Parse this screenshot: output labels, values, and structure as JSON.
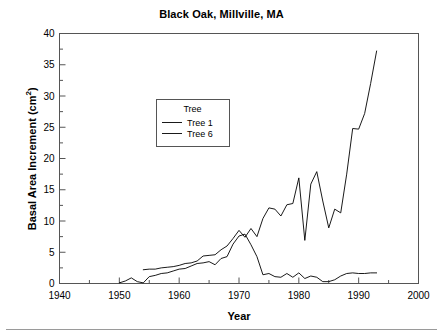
{
  "chart_data": {
    "type": "line",
    "title": "Black Oak, Millville, MA",
    "xlabel": "Year",
    "ylabel": "Basal Area Increment (cm²)",
    "xlim": [
      1940,
      2000
    ],
    "ylim": [
      0,
      40
    ],
    "xticks": [
      1940,
      1950,
      1960,
      1970,
      1980,
      1990,
      2000
    ],
    "xtick_labels": [
      "1940",
      "1950",
      "1960",
      "1970",
      "1980",
      "1990",
      "2000"
    ],
    "xminor_ticks": [
      1945,
      1955,
      1965,
      1975,
      1985,
      1995
    ],
    "yticks": [
      0,
      5,
      10,
      15,
      20,
      25,
      30,
      35,
      40
    ],
    "ytick_labels": [
      "0",
      "5",
      "10",
      "15",
      "20",
      "25",
      "30",
      "35",
      "40"
    ],
    "yminor_ticks": [
      2.5,
      7.5,
      12.5,
      17.5,
      22.5,
      27.5,
      32.5,
      37.5
    ],
    "grid": false,
    "legend_title": "Tree",
    "legend_position": "upper-left-inside",
    "line_color": "#000000",
    "series": [
      {
        "name": "Tree 1",
        "x": [
          1954,
          1955,
          1956,
          1957,
          1958,
          1959,
          1960,
          1961,
          1962,
          1963,
          1964,
          1965,
          1966,
          1967,
          1968,
          1969,
          1970,
          1971,
          1972,
          1973,
          1974,
          1975,
          1976,
          1977,
          1978,
          1979,
          1980,
          1981,
          1982,
          1983,
          1984,
          1985,
          1986,
          1987,
          1988,
          1989,
          1990,
          1991,
          1992,
          1993
        ],
        "values": [
          2.2,
          2.3,
          2.3,
          2.5,
          2.6,
          2.7,
          2.9,
          3.2,
          3.3,
          3.6,
          4.4,
          4.5,
          4.6,
          5.4,
          6.0,
          7.2,
          8.5,
          7.4,
          8.8,
          7.5,
          10.4,
          12.1,
          11.9,
          10.8,
          12.6,
          12.8,
          16.9,
          6.9,
          15.9,
          17.9,
          13.2,
          8.9,
          11.9,
          11.3,
          17.5,
          24.8,
          24.7,
          27.2,
          32.0,
          37.2
        ]
      },
      {
        "name": "Tree 6",
        "x": [
          1950,
          1951,
          1952,
          1953,
          1954,
          1955,
          1956,
          1957,
          1958,
          1959,
          1960,
          1961,
          1962,
          1963,
          1964,
          1965,
          1966,
          1967,
          1968,
          1969,
          1970,
          1971,
          1972,
          1973,
          1974,
          1975,
          1976,
          1977,
          1978,
          1979,
          1980,
          1981,
          1982,
          1983,
          1984,
          1985,
          1986,
          1987,
          1988,
          1989,
          1990,
          1991,
          1992,
          1993
        ],
        "values": [
          0.1,
          0.4,
          0.9,
          0.3,
          0.1,
          1.1,
          1.3,
          1.6,
          1.7,
          2.0,
          2.3,
          2.4,
          2.8,
          3.2,
          3.3,
          3.5,
          3.0,
          4.0,
          4.3,
          6.3,
          7.6,
          7.9,
          6.2,
          4.3,
          1.4,
          1.6,
          1.1,
          1.0,
          1.6,
          1.0,
          1.7,
          0.8,
          1.2,
          1.0,
          0.3,
          0.3,
          0.6,
          1.2,
          1.6,
          1.7,
          1.6,
          1.6,
          1.7,
          1.7
        ]
      }
    ]
  },
  "legend": {
    "title": "Tree",
    "entries": [
      {
        "label": "Tree 1"
      },
      {
        "label": "Tree 6"
      }
    ]
  },
  "axes": {
    "x_title": "Year",
    "y_title_text": "Basal Area Increment (cm",
    "y_title_sup": "2",
    "y_title_tail": ")"
  },
  "header": {
    "title": "Black Oak, Millville, MA"
  }
}
